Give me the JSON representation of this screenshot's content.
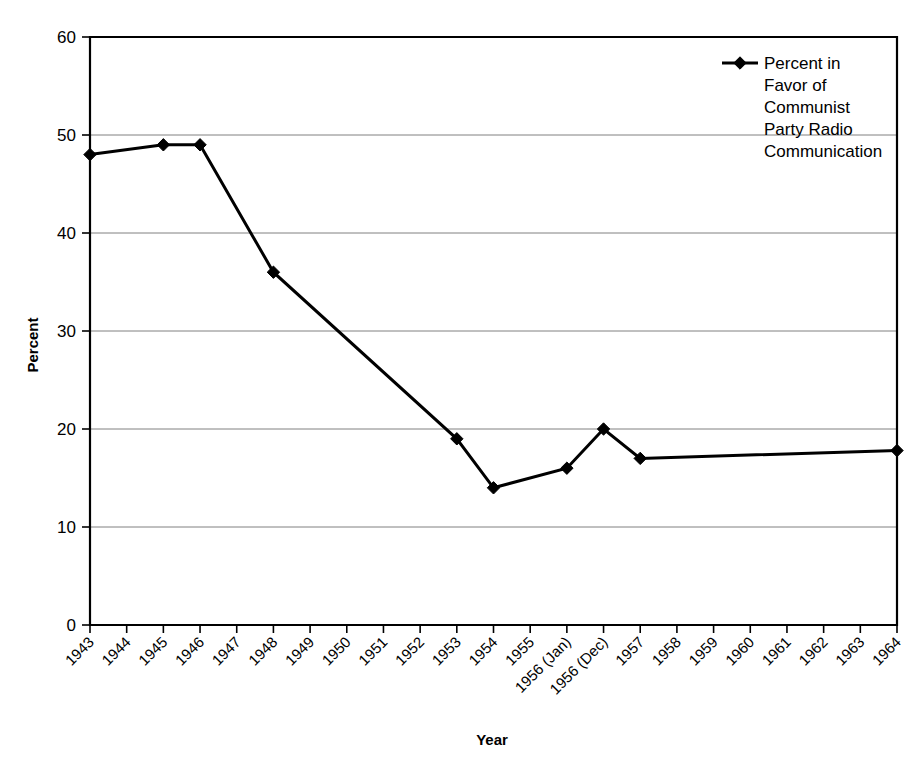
{
  "chart_data": {
    "type": "line",
    "title": "",
    "xlabel": "Year",
    "ylabel": "Percent",
    "ylim": [
      0,
      60
    ],
    "ytick_step": 10,
    "yticks": [
      "0",
      "10",
      "20",
      "30",
      "40",
      "50",
      "60"
    ],
    "grid": "horizontal",
    "legend_position": "top-right-inside",
    "categories": [
      "1943",
      "1944",
      "1945",
      "1946",
      "1947",
      "1948",
      "1949",
      "1950",
      "1951",
      "1952",
      "1953",
      "1954",
      "1955",
      "1956 (Jan)",
      "1956 (Dec)",
      "1957",
      "1958",
      "1959",
      "1960",
      "1961",
      "1962",
      "1963",
      "1964"
    ],
    "series": [
      {
        "name": "Percent in Favor of Communist Party Radio Communication",
        "values": [
          48,
          null,
          49,
          49,
          null,
          36,
          null,
          null,
          null,
          null,
          19,
          14,
          null,
          16,
          20,
          17,
          null,
          null,
          null,
          null,
          null,
          null,
          17.8
        ]
      }
    ],
    "marker": "diamond",
    "line_color": "#000000"
  },
  "legend": {
    "entries": [
      {
        "marker": "diamond-marker",
        "lines": [
          "Percent in",
          "Favor of",
          "Communist",
          "Party Radio",
          "Communication"
        ]
      }
    ]
  },
  "axes": {
    "y_title": "Percent",
    "x_title": "Year"
  }
}
